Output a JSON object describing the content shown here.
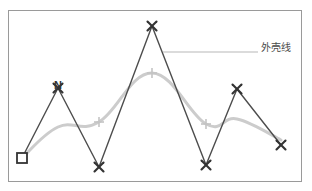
{
  "figure": {
    "title": "",
    "border_color": "#9a9a9a",
    "background": "#ffffff",
    "width": 312,
    "height": 191
  },
  "annotation": {
    "label": "外壳线",
    "leader_line": {
      "from_x": 163,
      "from_y": 52,
      "to_x": 258,
      "to_y": 52,
      "color": "#b8b8b8"
    },
    "text_color": "#4a4a4a"
  },
  "chart_data": {
    "type": "line",
    "title": "",
    "xlabel": "",
    "ylabel": "",
    "grid": false,
    "legend": "annotation",
    "xlim": [
      0,
      312
    ],
    "ylim": [
      191,
      0
    ],
    "series": [
      {
        "name": "zigzag-polyline",
        "color": "#4d4d4d",
        "line_width": 1.4,
        "marker": "x",
        "marker_color": "#333333",
        "points": [
          {
            "x": 22,
            "y": 158,
            "marker": "square",
            "label": ""
          },
          {
            "x": 58,
            "y": 88,
            "marker": "x",
            "label": "N"
          },
          {
            "x": 99,
            "y": 167,
            "marker": "x",
            "label": ""
          },
          {
            "x": 152,
            "y": 26,
            "marker": "x",
            "label": ""
          },
          {
            "x": 206,
            "y": 165,
            "marker": "x",
            "label": ""
          },
          {
            "x": 237,
            "y": 89,
            "marker": "x",
            "label": ""
          },
          {
            "x": 281,
            "y": 145,
            "marker": "x",
            "label": ""
          }
        ]
      },
      {
        "name": "hull-line",
        "color": "#cccccc",
        "line_width": 3,
        "marker": "plus",
        "marker_color": "#c4c4c4",
        "points": [
          {
            "x": 22,
            "y": 158,
            "marker": "none"
          },
          {
            "x": 58,
            "y": 127,
            "marker": "none"
          },
          {
            "x": 99,
            "y": 122,
            "marker": "plus"
          },
          {
            "x": 152,
            "y": 73,
            "marker": "plus"
          },
          {
            "x": 206,
            "y": 124,
            "marker": "plus"
          },
          {
            "x": 237,
            "y": 119,
            "marker": "none"
          },
          {
            "x": 281,
            "y": 140,
            "marker": "none"
          }
        ]
      }
    ]
  }
}
